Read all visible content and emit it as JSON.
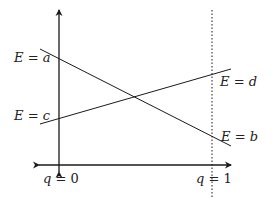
{
  "diagram": {
    "type": "energy-level-crossing",
    "colors": {
      "ink": "#1a1a1a",
      "background": "#ffffff"
    },
    "axes": {
      "vertical": {
        "x": 59,
        "y_top": 10,
        "y_bottom": 172
      },
      "horizontal": {
        "y": 165,
        "x_left": 39,
        "x_right": 231
      }
    },
    "dotted_line": {
      "x": 212,
      "y_top": 10,
      "y_bottom": 198
    },
    "lines": [
      {
        "id": "a-to-b",
        "x1": 40,
        "y1": 49,
        "x2": 231,
        "y2": 146
      },
      {
        "id": "c-to-d",
        "x1": 40,
        "y1": 124,
        "x2": 231,
        "y2": 69
      }
    ],
    "labels": {
      "E_a": {
        "var": "E",
        "eq": " = ",
        "val": "a"
      },
      "E_c": {
        "var": "E",
        "eq": " = ",
        "val": "c"
      },
      "E_d": {
        "var": "E",
        "eq": " = ",
        "val": "d"
      },
      "E_b": {
        "var": "E",
        "eq": " = ",
        "val": "b"
      },
      "q0": {
        "var": "q",
        "eq": " = ",
        "val": "0"
      },
      "q1": {
        "var": "q",
        "eq": " = ",
        "val": "1"
      }
    }
  }
}
